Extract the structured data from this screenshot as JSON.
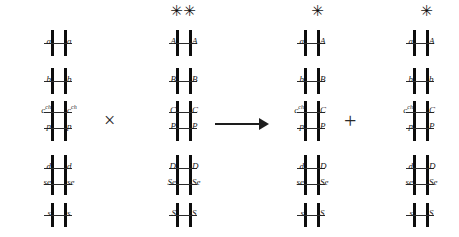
{
  "diagram": {
    "ink_color": "#1a1a1a",
    "star_glyph": "✳",
    "operators": {
      "cross": "×",
      "plus": "+",
      "arrow": "→"
    }
  },
  "genotypes": [
    {
      "name": "parent-1",
      "loci": [
        {
          "id": "a",
          "left": "a",
          "right": "a",
          "left_sup": "",
          "right_sup": ""
        },
        {
          "id": "b",
          "left": "b",
          "right": "b",
          "left_sup": "",
          "right_sup": ""
        },
        {
          "id": "c",
          "left": "c",
          "right": "c",
          "left_sup": "ch",
          "right_sup": "ch"
        },
        {
          "id": "p",
          "left": "p",
          "right": "p",
          "left_sup": "",
          "right_sup": ""
        },
        {
          "id": "d",
          "left": "d",
          "right": "d",
          "left_sup": "",
          "right_sup": ""
        },
        {
          "id": "se",
          "left": "se",
          "right": "se",
          "left_sup": "",
          "right_sup": ""
        },
        {
          "id": "s",
          "left": "s",
          "right": "s",
          "left_sup": "",
          "right_sup": ""
        }
      ],
      "stars": []
    },
    {
      "name": "parent-2",
      "loci": [
        {
          "id": "a",
          "left": "A",
          "right": "A",
          "left_sup": "",
          "right_sup": ""
        },
        {
          "id": "b",
          "left": "B",
          "right": "B",
          "left_sup": "",
          "right_sup": ""
        },
        {
          "id": "c",
          "left": "C",
          "right": "C",
          "left_sup": "",
          "right_sup": ""
        },
        {
          "id": "p",
          "left": "P",
          "right": "P",
          "left_sup": "",
          "right_sup": ""
        },
        {
          "id": "d",
          "left": "D",
          "right": "D",
          "left_sup": "",
          "right_sup": ""
        },
        {
          "id": "se",
          "left": "Se",
          "right": "Se",
          "left_sup": "",
          "right_sup": ""
        },
        {
          "id": "s",
          "left": "S",
          "right": "S",
          "left_sup": "",
          "right_sup": ""
        }
      ],
      "stars": [
        "left",
        "right"
      ]
    },
    {
      "name": "offspring-1",
      "loci": [
        {
          "id": "a",
          "left": "a",
          "right": "A",
          "left_sup": "",
          "right_sup": ""
        },
        {
          "id": "b",
          "left": "b",
          "right": "B",
          "left_sup": "",
          "right_sup": ""
        },
        {
          "id": "c",
          "left": "c",
          "right": "C",
          "left_sup": "ch",
          "right_sup": ""
        },
        {
          "id": "p",
          "left": "p",
          "right": "P",
          "left_sup": "",
          "right_sup": ""
        },
        {
          "id": "d",
          "left": "d",
          "right": "D",
          "left_sup": "",
          "right_sup": ""
        },
        {
          "id": "se",
          "left": "se",
          "right": "Se",
          "left_sup": "",
          "right_sup": ""
        },
        {
          "id": "s",
          "left": "s",
          "right": "S",
          "left_sup": "",
          "right_sup": ""
        }
      ],
      "stars": [
        "right"
      ]
    },
    {
      "name": "offspring-2",
      "loci": [
        {
          "id": "a",
          "left": "a",
          "right": "A",
          "left_sup": "",
          "right_sup": ""
        },
        {
          "id": "b",
          "left": "b",
          "right": "b",
          "left_sup": "",
          "right_sup": ""
        },
        {
          "id": "c",
          "left": "c",
          "right": "C",
          "left_sup": "ch",
          "right_sup": ""
        },
        {
          "id": "p",
          "left": "p",
          "right": "P",
          "left_sup": "",
          "right_sup": ""
        },
        {
          "id": "d",
          "left": "d",
          "right": "D",
          "left_sup": "",
          "right_sup": ""
        },
        {
          "id": "se",
          "left": "se",
          "right": "Se",
          "left_sup": "",
          "right_sup": ""
        },
        {
          "id": "s",
          "left": "s",
          "right": "S",
          "left_sup": "",
          "right_sup": ""
        }
      ],
      "stars": [
        "right"
      ]
    }
  ]
}
